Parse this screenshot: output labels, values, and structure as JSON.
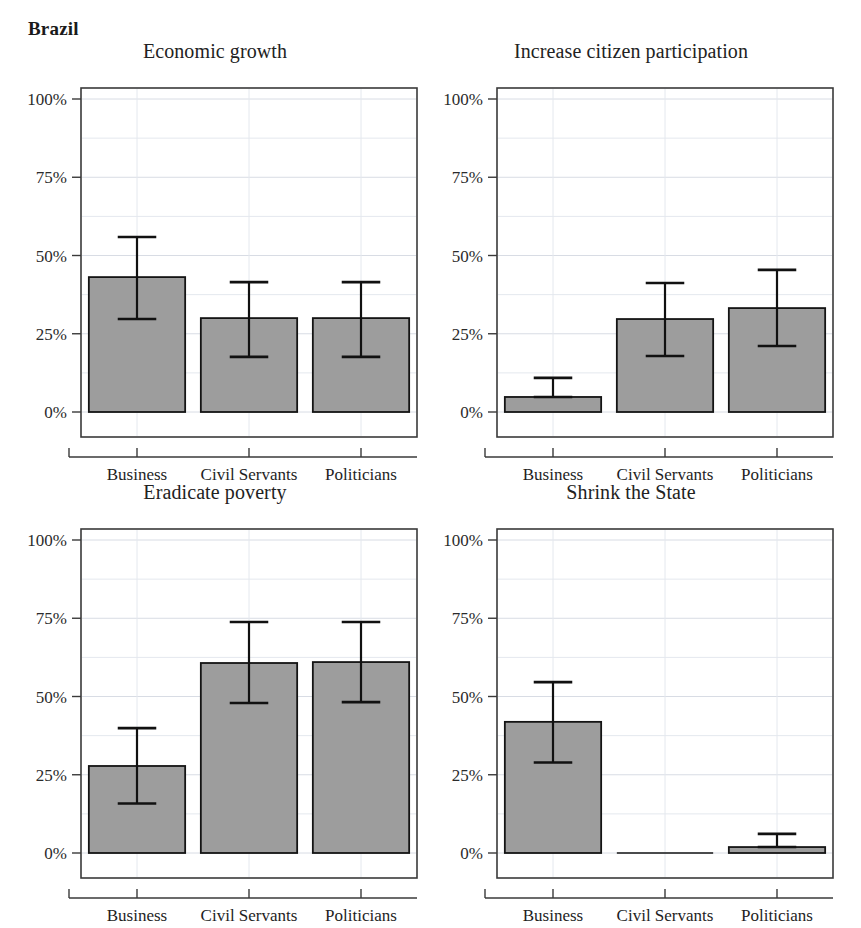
{
  "figure": {
    "country_title": "Brazil",
    "categories": [
      "Business",
      "Civil Servants",
      "Politicians"
    ],
    "y_ticks": [
      0,
      25,
      50,
      75,
      100
    ],
    "y_tick_labels": [
      "0%",
      "25%",
      "50%",
      "75%",
      "100%"
    ],
    "bar_color": "#9d9d9d",
    "bar_edge_color": "#141414",
    "error_color": "#111111",
    "grid_color": "#d8dce4"
  },
  "chart_data": [
    {
      "type": "bar",
      "title": "Economic growth",
      "xlabel": "",
      "ylabel": "",
      "ylim": [
        0,
        107
      ],
      "grid": true,
      "categories": [
        "Business",
        "Civil Servants",
        "Politicians"
      ],
      "values": [
        43.1,
        30.0,
        30.0
      ],
      "error_low": [
        29.7,
        17.6,
        17.6
      ],
      "error_high": [
        55.9,
        41.5,
        41.5
      ]
    },
    {
      "type": "bar",
      "title": "Increase citizen participation",
      "xlabel": "",
      "ylabel": "",
      "ylim": [
        0,
        107
      ],
      "grid": true,
      "categories": [
        "Business",
        "Civil Servants",
        "Politicians"
      ],
      "values": [
        4.8,
        29.7,
        33.2
      ],
      "error_low": [
        4.8,
        17.9,
        21.1
      ],
      "error_high": [
        10.9,
        41.2,
        45.4
      ]
    },
    {
      "type": "bar",
      "title": "Eradicate poverty",
      "xlabel": "",
      "ylabel": "",
      "ylim": [
        0,
        107
      ],
      "grid": true,
      "categories": [
        "Business",
        "Civil Servants",
        "Politicians"
      ],
      "values": [
        27.8,
        60.7,
        61.0
      ],
      "error_low": [
        15.8,
        47.9,
        48.2
      ],
      "error_high": [
        39.9,
        73.8,
        73.8
      ]
    },
    {
      "type": "bar",
      "title": "Shrink the State",
      "xlabel": "",
      "ylabel": "",
      "ylim": [
        0,
        107
      ],
      "grid": true,
      "categories": [
        "Business",
        "Civil Servants",
        "Politicians"
      ],
      "values": [
        41.9,
        0.0,
        1.9
      ],
      "error_low": [
        28.9,
        0.0,
        1.9
      ],
      "error_high": [
        54.6,
        0.0,
        6.1
      ]
    }
  ]
}
